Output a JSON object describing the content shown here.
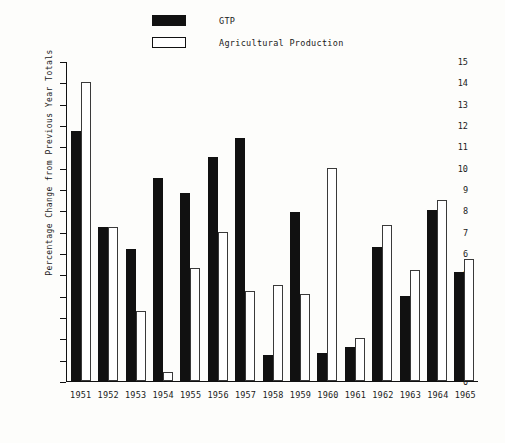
{
  "chart_data": {
    "type": "bar",
    "title": "",
    "xlabel": "",
    "ylabel": "Percentage Change from Previous Year Totals",
    "ylim": [
      0,
      15
    ],
    "grid": false,
    "legend_position": "top-left",
    "categories": [
      "1951",
      "1952",
      "1953",
      "1954",
      "1955",
      "1956",
      "1957",
      "1958",
      "1959",
      "1960",
      "1961",
      "1962",
      "1963",
      "1964",
      "1965"
    ],
    "ytick_labels": [
      "0",
      "1",
      "2",
      "3",
      "4",
      "5",
      "6",
      "7",
      "8",
      "9",
      "10",
      "11",
      "12",
      "13",
      "14",
      "15"
    ],
    "series": [
      {
        "name": "GTP",
        "color": "#111111",
        "style": "filled",
        "values": [
          11.7,
          7.2,
          6.2,
          9.5,
          8.8,
          10.5,
          11.4,
          1.2,
          7.9,
          1.3,
          1.6,
          6.3,
          4.0,
          8.0,
          5.1
        ]
      },
      {
        "name": "Agricultural Production",
        "color": "#ffffff",
        "style": "hollow",
        "values": [
          14.0,
          7.2,
          3.3,
          0.4,
          5.3,
          7.0,
          4.2,
          4.5,
          4.1,
          10.0,
          2.0,
          7.3,
          5.2,
          8.5,
          5.7
        ]
      }
    ]
  },
  "legend": {
    "items": [
      {
        "label": "GTP",
        "style": "filled"
      },
      {
        "label": "Agricultural Production",
        "style": "hollow"
      }
    ]
  }
}
